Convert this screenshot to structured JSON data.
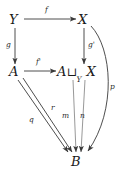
{
  "figure": {
    "kind": "commutative-diagram",
    "background_color": "#ffffff",
    "stroke_color": "#3a3a3a",
    "text_color": "#1a1a1a"
  },
  "objects": [
    {
      "id": "Y",
      "label": "Y",
      "x": 14,
      "y": 21
    },
    {
      "id": "X",
      "label": "X",
      "x": 83,
      "y": 21
    },
    {
      "id": "A",
      "label": "A",
      "x": 14,
      "y": 73
    },
    {
      "id": "P",
      "label": "A ⊔Y X",
      "head": "A",
      "operator": "⊔",
      "subscript": "Y",
      "tail": "X",
      "x": 76,
      "y": 73
    },
    {
      "id": "B",
      "label": "B",
      "x": 76,
      "y": 163
    }
  ],
  "morphisms": [
    {
      "id": "f",
      "label": "f",
      "from": "Y",
      "to": "X",
      "shape": "straight-horizontal",
      "label_x": 45,
      "label_y": 11
    },
    {
      "id": "g",
      "label": "g",
      "from": "Y",
      "to": "A",
      "shape": "straight-vertical",
      "label_x": 6,
      "label_y": 45
    },
    {
      "id": "gp",
      "label": "g'",
      "from": "X",
      "to": "P",
      "shape": "straight-vertical",
      "label_x": 71,
      "label_y": 45
    },
    {
      "id": "fp",
      "label": "f'",
      "from": "A",
      "to": "P",
      "shape": "straight-horizontal",
      "label_x": 36,
      "label_y": 63
    },
    {
      "id": "q",
      "label": "q",
      "from": "A",
      "to": "B",
      "shape": "diagonal",
      "label_x": 29,
      "label_y": 119
    },
    {
      "id": "r",
      "label": "r",
      "from": "A",
      "to": "B",
      "shape": "diagonal",
      "label_x": 51,
      "label_y": 107
    },
    {
      "id": "m",
      "label": "m",
      "from": "P",
      "to": "B",
      "shape": "straight-vertical",
      "label_x": 64,
      "label_y": 115
    },
    {
      "id": "n",
      "label": "n",
      "from": "P",
      "to": "B",
      "shape": "straight-vertical",
      "label_x": 82,
      "label_y": 115
    },
    {
      "id": "p",
      "label": "p",
      "from": "X",
      "to": "B",
      "shape": "curve",
      "label_x": 112,
      "label_y": 86
    }
  ]
}
